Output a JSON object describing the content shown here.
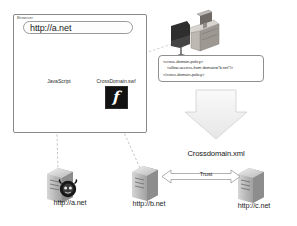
{
  "diagram": {
    "background": "#ffffff"
  },
  "browser": {
    "chrome_label": "Browser",
    "url_value": "http://a.net",
    "url_placeholder": "http://a.net"
  },
  "assets": {
    "javascript": {
      "label": "JavaScript",
      "icon": "script-document-icon"
    },
    "flash_movie": {
      "label": "CrossDomain.swf",
      "icon": "flash-swf-icon",
      "glyph": "f"
    },
    "connector_label": ""
  },
  "workstation": {
    "icon": "desk-workstation-icon",
    "label": ""
  },
  "policy": {
    "lines": [
      "<cross-domain-policy>",
      "<allow-access-from domain=\"b.net\"/>",
      "</cross-domain-policy>"
    ],
    "line1": "<cross-domain-policy>",
    "line2": "<allow-access-from domain=\"b.net\"/>",
    "line3": "</cross-domain-policy>"
  },
  "servers": [
    {
      "id": "a",
      "label": "http://a.net",
      "icon": "server-rack-icon",
      "badge": "hacker-skull-icon"
    },
    {
      "id": "b",
      "label": "http://b.net",
      "icon": "server-rack-icon",
      "badge": ""
    },
    {
      "id": "c",
      "label": "http://c.net",
      "icon": "server-rack-icon",
      "badge": ""
    }
  ],
  "relations": {
    "crossdomain_caption": "Crossdomain.xml",
    "trust_label": "Trust"
  },
  "colors": {
    "line": "#8a8a8a",
    "text": "#1d1d1d",
    "flash_bg": "#121212",
    "arrow_fill": "#f2f2f2",
    "arrow_stroke": "#c8c8c8",
    "server_body": "#9a9a9a"
  }
}
